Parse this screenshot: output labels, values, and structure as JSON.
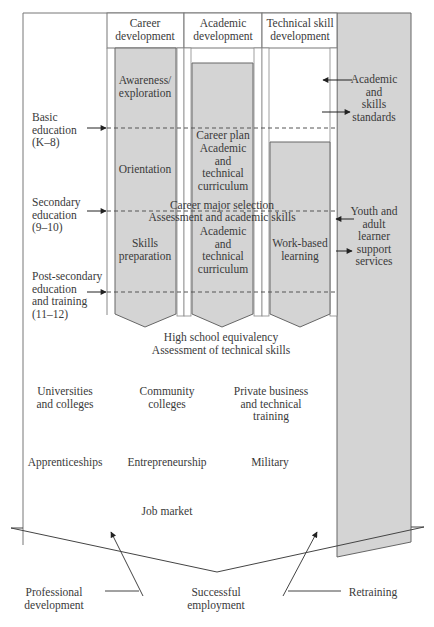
{
  "columns": {
    "career": {
      "header_line1": "Career",
      "header_line2": "development"
    },
    "academic": {
      "header_line1": "Academic",
      "header_line2": "development"
    },
    "technical": {
      "header_line1": "Technical skill",
      "header_line2": "development"
    }
  },
  "stages": [
    {
      "line1": "Basic",
      "line2": "education",
      "line3": "(K–8)"
    },
    {
      "line1": "Secondary",
      "line2": "education",
      "line3": "(9–10)"
    },
    {
      "line1": "Post-secondary",
      "line2": "education",
      "line3": "and training",
      "line4": "(11–12)"
    }
  ],
  "career_blocks": {
    "awareness_1": "Awareness/",
    "awareness_2": "exploration",
    "orientation": "Orientation",
    "skills_1": "Skills",
    "skills_2": "preparation"
  },
  "academic_blocks": {
    "career_plan": "Career plan",
    "curriculum_a1": "Academic",
    "curriculum_a2": "and",
    "curriculum_a3": "technical",
    "curriculum_a4": "curriculum",
    "curriculum_b1": "Academic",
    "curriculum_b2": "and",
    "curriculum_b3": "technical",
    "curriculum_b4": "curriculum"
  },
  "technical_blocks": {
    "work_based_1": "Work-based",
    "work_based_2": "learning"
  },
  "milestones": {
    "career_major": "Career major selection",
    "assessment_academic": "Assessment and academic skills",
    "hs_equivalency": "High school equivalency",
    "assessment_technical": "Assessment of technical skills"
  },
  "side_panel": {
    "standards_1": "Academic",
    "standards_2": "and",
    "standards_3": "skills",
    "standards_4": "standards",
    "support_1": "Youth and",
    "support_2": "adult",
    "support_3": "learner",
    "support_4": "support",
    "support_5": "services"
  },
  "outcomes": {
    "universities_1": "Universities",
    "universities_2": "and colleges",
    "community_1": "Community",
    "community_2": "colleges",
    "private_1": "Private business",
    "private_2": "and technical",
    "private_3": "training",
    "apprenticeships": "Apprenticeships",
    "entrepreneurship": "Entrepreneurship",
    "military": "Military",
    "job_market": "Job market"
  },
  "bottom": {
    "professional_1": "Professional",
    "professional_2": "development",
    "successful_1": "Successful",
    "successful_2": "employment",
    "retraining": "Retraining"
  },
  "colors": {
    "fill_gray": "#d4d4d4",
    "line": "#555555",
    "text": "#3a3a3a"
  }
}
